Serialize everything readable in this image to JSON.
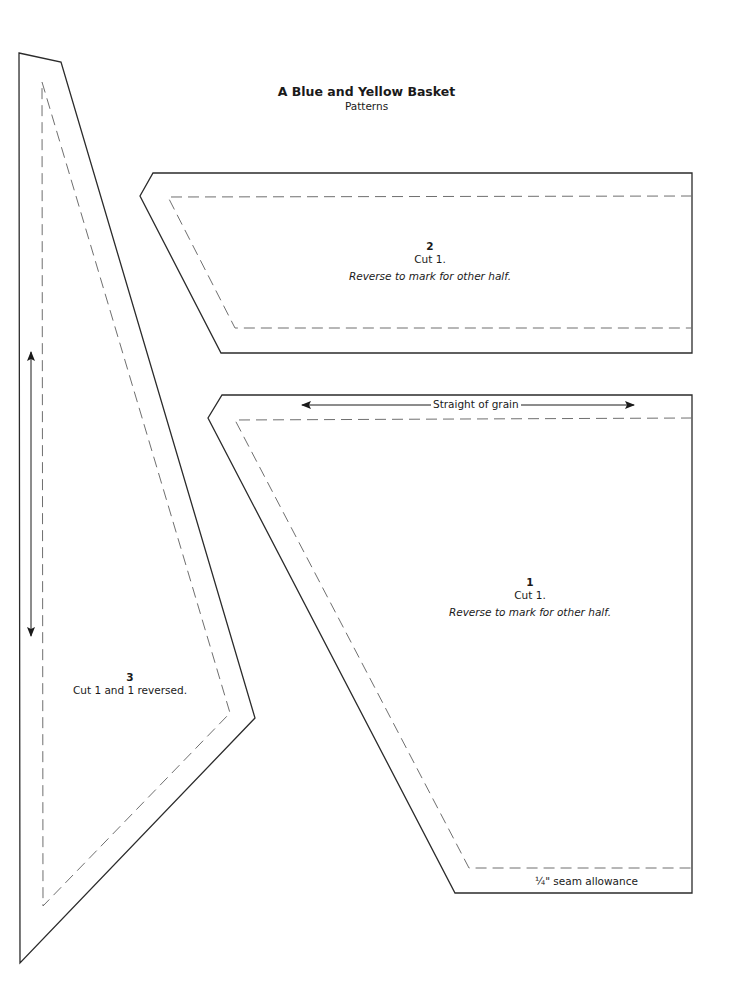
{
  "header": {
    "title": "A Blue and Yellow Basket",
    "subtitle": "Patterns"
  },
  "pieces": [
    {
      "number": "1",
      "cut": "Cut 1.",
      "note": "Reverse to mark for other half.",
      "grain_label": "Straight of grain",
      "seam_label": "¼\" seam allowance"
    },
    {
      "number": "2",
      "cut": "Cut 1.",
      "note": "Reverse to mark for other half."
    },
    {
      "number": "3",
      "cut": "Cut 1 and 1 reversed."
    }
  ],
  "colors": {
    "outline": "#2b2b2b",
    "seam_line": "#6f6f6f",
    "background": "#ffffff"
  }
}
